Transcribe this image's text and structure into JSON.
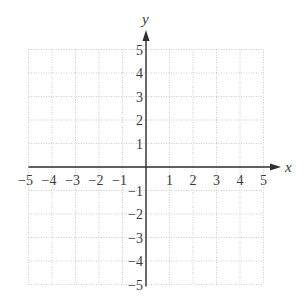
{
  "chart_data": {
    "type": "scatter",
    "title": "",
    "xlabel": "x",
    "ylabel": "y",
    "xlim": [
      -5,
      5
    ],
    "ylim": [
      -5,
      5
    ],
    "grid": true,
    "grid_style": "dotted",
    "x_ticks": [
      -5,
      -4,
      -3,
      -2,
      -1,
      1,
      2,
      3,
      4,
      5
    ],
    "y_ticks": [
      -5,
      -4,
      -3,
      -2,
      -1,
      1,
      2,
      3,
      4,
      5
    ],
    "x_tick_labels": [
      "−5",
      "−4",
      "−3",
      "−2",
      "−1",
      "1",
      "2",
      "3",
      "4",
      "5"
    ],
    "y_tick_labels": [
      "−5",
      "−4",
      "−3",
      "−2",
      "−1",
      "1",
      "2",
      "3",
      "4",
      "5"
    ],
    "series": [],
    "legend": null
  },
  "colors": {
    "axis": "#2f2f2f",
    "grid": "#bdbdbd",
    "text": "#3a3a3a"
  }
}
